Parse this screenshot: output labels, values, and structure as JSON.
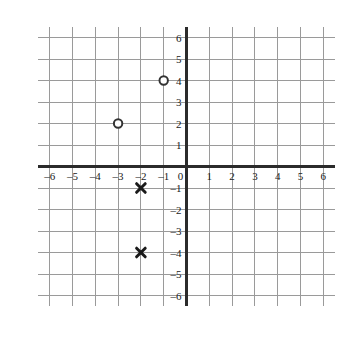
{
  "chart_data": {
    "type": "scatter",
    "title": "",
    "xlabel": "",
    "ylabel": "",
    "xlim": [
      -6.5,
      6.5
    ],
    "ylim": [
      -6.5,
      6.5
    ],
    "grid": true,
    "legend": "none",
    "x_ticks": [
      -6,
      -5,
      -4,
      -3,
      -2,
      -1,
      0,
      1,
      2,
      3,
      4,
      5,
      6
    ],
    "y_ticks": [
      -6,
      -5,
      -4,
      -3,
      -2,
      -1,
      1,
      2,
      3,
      4,
      5,
      6
    ],
    "x_tick_labels": [
      "–6",
      "–5",
      "–4",
      "–3",
      "–2",
      "–1",
      "0",
      "1",
      "2",
      "3",
      "4",
      "5",
      "6"
    ],
    "y_tick_labels": [
      "–6",
      "–5",
      "–4",
      "–3",
      "–2",
      "–1",
      "1",
      "2",
      "3",
      "4",
      "5",
      "6"
    ],
    "origin_label": "0",
    "series": [
      {
        "name": "open-circle-points",
        "marker": "circle-open",
        "color": "#333333",
        "points": [
          {
            "x": -1,
            "y": 4
          },
          {
            "x": -3,
            "y": 2
          }
        ]
      },
      {
        "name": "cross-points",
        "marker": "x",
        "color": "#1a1a1a",
        "points": [
          {
            "x": -2,
            "y": -1
          },
          {
            "x": -2,
            "y": -4
          }
        ]
      }
    ],
    "colors": {
      "grid_line": "#9a9a9a",
      "axis_line": "#2b2b2b",
      "background": "#ffffff",
      "label_text": "#1a1a1a"
    }
  }
}
